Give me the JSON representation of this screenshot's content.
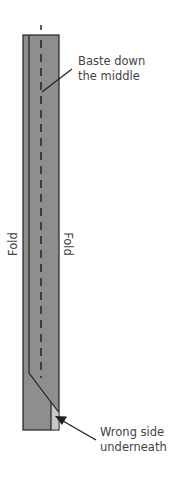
{
  "diagram": {
    "type": "sewing-instruction",
    "labels": {
      "baste_line1": "Baste down",
      "baste_line2": "the middle",
      "fold_left": "Fold",
      "fold_right": "Fold",
      "wrong_line1": "Wrong side",
      "wrong_line2": "underneath"
    },
    "colors": {
      "fabric_right_side": "#8e8e8e",
      "fabric_wrong_side": "#c8c8c8",
      "outline": "#222222",
      "text": "#444444"
    }
  }
}
